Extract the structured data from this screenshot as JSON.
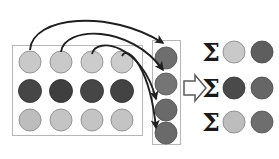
{
  "figure": {
    "colors": {
      "background": "#ffffff",
      "box_stroke": "#b6b6b6",
      "arrow_stroke": "#1f1f1f",
      "circle_stroke": "#7d7d7d",
      "light_gray": "#c9c9c9",
      "mid_light_gray": "#bdbdbd",
      "mid_gray": "#8a8a8a",
      "dark_gray": "#4a4a4a",
      "very_dark_gray": "#3c3c3c",
      "block_arrow_fill": "#ffffff",
      "block_arrow_stroke": "#5a5a5a",
      "sigma_color": "#1a1a1a"
    },
    "source_grid": {
      "label": "source-feature-grid",
      "columns": 4,
      "rows": 3,
      "box": {
        "x": 12,
        "y": 45,
        "width": 130,
        "height": 90
      },
      "cells": [
        {
          "row": 0,
          "col": 0,
          "color": "#c9c9c9"
        },
        {
          "row": 0,
          "col": 1,
          "color": "#c9c9c9"
        },
        {
          "row": 0,
          "col": 2,
          "color": "#cccccc"
        },
        {
          "row": 0,
          "col": 3,
          "color": "#cccccc"
        },
        {
          "row": 1,
          "col": 0,
          "color": "#464646"
        },
        {
          "row": 1,
          "col": 1,
          "color": "#3f3f3f"
        },
        {
          "row": 1,
          "col": 2,
          "color": "#464646"
        },
        {
          "row": 1,
          "col": 3,
          "color": "#434343"
        },
        {
          "row": 2,
          "col": 0,
          "color": "#bdbdbd"
        },
        {
          "row": 2,
          "col": 1,
          "color": "#c4c4c4"
        },
        {
          "row": 2,
          "col": 2,
          "color": "#c4c4c4"
        },
        {
          "row": 2,
          "col": 3,
          "color": "#c4c4c4"
        }
      ]
    },
    "pooled_column": {
      "label": "pooled-column",
      "box": {
        "x": 152,
        "y": 40,
        "width": 29,
        "height": 105
      },
      "cells": [
        {
          "index": 0,
          "color": "#6e6e6e"
        },
        {
          "index": 1,
          "color": "#757575"
        },
        {
          "index": 2,
          "color": "#6a6a6a"
        },
        {
          "index": 3,
          "color": "#6a6a6a"
        }
      ]
    },
    "block_arrow": {
      "label": "block-arrow-right",
      "x": 183,
      "y": 75,
      "width": 23,
      "height": 25
    },
    "sum_rows": [
      {
        "symbol": "Σ",
        "circles": [
          {
            "color": "#c9c9c9"
          },
          {
            "color": "#5e5e5e"
          }
        ]
      },
      {
        "symbol": "Σ",
        "circles": [
          {
            "color": "#4a4a4a"
          },
          {
            "color": "#666666"
          }
        ]
      },
      {
        "symbol": "Σ",
        "circles": [
          {
            "color": "#bdbdbd"
          },
          {
            "color": "#6e6e6e"
          }
        ]
      }
    ],
    "curved_arrows": [
      {
        "from": "grid-cell-r0c0",
        "to": "pooled-cell-0"
      },
      {
        "from": "grid-cell-r0c1",
        "to": "pooled-cell-1"
      },
      {
        "from": "grid-cell-r0c2",
        "to": "pooled-cell-2"
      },
      {
        "from": "grid-cell-r0c3",
        "to": "pooled-cell-3"
      }
    ]
  }
}
